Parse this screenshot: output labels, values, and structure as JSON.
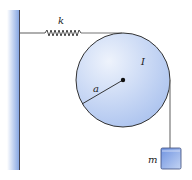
{
  "diagram": {
    "type": "physics-pulley-spring-mass",
    "labels": {
      "spring": "k",
      "inertia": "I",
      "radius": "a",
      "mass": "m"
    },
    "colors": {
      "wall": "#8fb0e8",
      "disc_fill": "#c9d9f5",
      "mass_fill": "#8fabe8",
      "line": "#333333",
      "string": "#777777"
    }
  }
}
